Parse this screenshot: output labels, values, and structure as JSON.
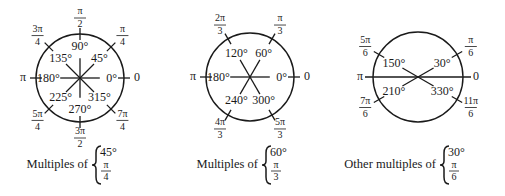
{
  "diagrams": [
    {
      "id": "multiples-45",
      "center": [
        80,
        78
      ],
      "radius": 44,
      "caption": "Multiples of",
      "brace_degree": "45°",
      "brace_radian_num": "π",
      "brace_radian_den": "4",
      "angles": [
        {
          "deg": 0,
          "deg_label": "0°",
          "rad_num": "0",
          "rad_den": ""
        },
        {
          "deg": 45,
          "deg_label": "45°",
          "rad_num": "π",
          "rad_den": "4"
        },
        {
          "deg": 90,
          "deg_label": "90°",
          "rad_num": "π",
          "rad_den": "2"
        },
        {
          "deg": 135,
          "deg_label": "135°",
          "rad_num": "3π",
          "rad_den": "4"
        },
        {
          "deg": 180,
          "deg_label": "180°",
          "rad_num": "π",
          "rad_den": ""
        },
        {
          "deg": 225,
          "deg_label": "225°",
          "rad_num": "5π",
          "rad_den": "4"
        },
        {
          "deg": 270,
          "deg_label": "270°",
          "rad_num": "3π",
          "rad_den": "2"
        },
        {
          "deg": 315,
          "deg_label": "315°",
          "rad_num": "7π",
          "rad_den": "4"
        }
      ]
    },
    {
      "id": "multiples-60",
      "center": [
        250,
        77
      ],
      "radius": 44,
      "caption": "Multiples of",
      "brace_degree": "60°",
      "brace_radian_num": "π",
      "brace_radian_den": "3",
      "angles": [
        {
          "deg": 0,
          "deg_label": "0°",
          "rad_num": "0",
          "rad_den": ""
        },
        {
          "deg": 60,
          "deg_label": "60°",
          "rad_num": "π",
          "rad_den": "3"
        },
        {
          "deg": 120,
          "deg_label": "120°",
          "rad_num": "2π",
          "rad_den": "3"
        },
        {
          "deg": 180,
          "deg_label": "180°",
          "rad_num": "π",
          "rad_den": ""
        },
        {
          "deg": 240,
          "deg_label": "240°",
          "rad_num": "4π",
          "rad_den": "3"
        },
        {
          "deg": 300,
          "deg_label": "300°",
          "rad_num": "5π",
          "rad_den": "3"
        }
      ]
    },
    {
      "id": "other-multiples-30",
      "center": [
        418,
        77
      ],
      "radius": 45,
      "caption": "Other multiples of",
      "brace_degree": "30°",
      "brace_radian_num": "π",
      "brace_radian_den": "6",
      "angles": [
        {
          "deg": 0,
          "deg_label": "",
          "rad_num": "0",
          "rad_den": ""
        },
        {
          "deg": 30,
          "deg_label": "30°",
          "rad_num": "π",
          "rad_den": "6"
        },
        {
          "deg": 150,
          "deg_label": "150°",
          "rad_num": "5π",
          "rad_den": "6"
        },
        {
          "deg": 180,
          "deg_label": "",
          "rad_num": "π",
          "rad_den": ""
        },
        {
          "deg": 210,
          "deg_label": "210°",
          "rad_num": "7π",
          "rad_den": "6"
        },
        {
          "deg": 330,
          "deg_label": "330°",
          "rad_num": "11π",
          "rad_den": "6"
        }
      ]
    }
  ],
  "colors": {
    "ink": "#1a1a1a",
    "background": "#ffffff"
  }
}
